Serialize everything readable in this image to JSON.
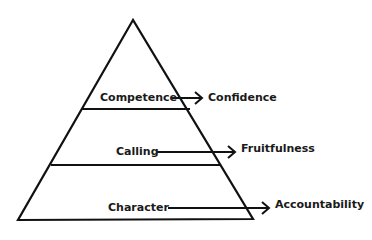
{
  "diagram": {
    "type": "pyramid",
    "stroke_color": "#111111",
    "text_color": "#1a1a1a",
    "levels": [
      {
        "label": "Competence",
        "outcome": "Confidence"
      },
      {
        "label": "Calling",
        "outcome": "Fruitfulness"
      },
      {
        "label": "Character",
        "outcome": "Accountability"
      }
    ]
  }
}
